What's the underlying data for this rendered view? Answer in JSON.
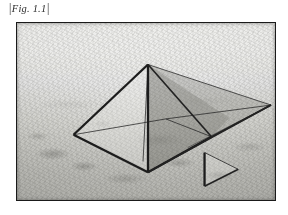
{
  "page": {
    "background_color": "#ffffff",
    "width": 288,
    "height": 215
  },
  "caption": {
    "bracket_left": "|",
    "text": "Fig. 1.1",
    "bracket_right": "|",
    "full_text": "|Fig. 1.1|",
    "style": "italic-serif",
    "color": "#2b2b2b"
  },
  "figure": {
    "name": "pyramid-perspective-photo",
    "border_color": "#1a1a1a",
    "frame": {
      "x": 16,
      "y": 22,
      "width": 260,
      "height": 179
    },
    "photo": {
      "subject": "desert landscape with geometric pyramid line overlay",
      "palette": {
        "sky": "#ececea",
        "midground": "#cfcfcb",
        "foreground": "#b1b1ac",
        "line_color": "#1c1c1c",
        "shaded_face": "#5c5c56"
      }
    },
    "overlay": {
      "type": "wireframe-perspective-construction",
      "shapes": [
        {
          "name": "pyramid-main",
          "description": "square-base pyramid in three-quarter perspective"
        },
        {
          "name": "pyramid-wing",
          "description": "long thin triangular extension to the vanishing point at right"
        },
        {
          "name": "small-triangle",
          "description": "small right-pointing triangle lower-right"
        }
      ],
      "vertices": {
        "apex": [
          148,
          64
        ],
        "base_left": [
          73,
          135
        ],
        "base_front": [
          148,
          173
        ],
        "base_right": [
          212,
          137
        ],
        "base_back": [
          140,
          106
        ],
        "vanishing_right": [
          272,
          105
        ]
      },
      "small_triangle": {
        "top_left": [
          205,
          153
        ],
        "bottom_left": [
          205,
          187
        ],
        "right_apex": [
          239,
          170
        ]
      }
    }
  }
}
